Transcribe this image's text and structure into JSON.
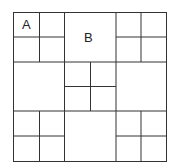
{
  "diagram": {
    "type": "square-subdivision-grid",
    "line_color": "#333333",
    "background": "#ffffff",
    "outer": {
      "x": 13,
      "y": 12,
      "w": 153,
      "h": 149
    },
    "labels": [
      {
        "text": "A",
        "x": 22,
        "y": 18
      },
      {
        "text": "B",
        "x": 84,
        "y": 31
      }
    ]
  }
}
